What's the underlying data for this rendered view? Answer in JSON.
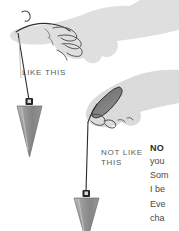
{
  "figure": {
    "type": "instructional-illustration",
    "background_color": "#ffffff"
  },
  "labels": {
    "correct": "LIKE THIS",
    "incorrect": "NOT LIKE\nTHIS"
  },
  "hands": [
    {
      "id": "open-hand",
      "posture": "open relaxed hand, cord draped over fingers",
      "demonstrates": "correct",
      "skin_fill": "#e3e3e3",
      "outline": "#3a3a3a"
    },
    {
      "id": "closed-fist",
      "posture": "clenched fist gripping cord",
      "demonstrates": "incorrect",
      "skin_fill": "#dedede",
      "shadow_fill": "#6f6f6f",
      "outline": "#2f2f2f"
    }
  ],
  "pendulums": [
    {
      "id": "pendulum-correct",
      "cone_fill": "#8b8b8b",
      "cone_highlight": "#b9b9b9",
      "cap_fill": "#2b2b2b",
      "cord_color": "#2b2b2b"
    },
    {
      "id": "pendulum-incorrect",
      "cone_fill": "#8b8b8b",
      "cone_highlight": "#b9b9b9",
      "cap_fill": "#2b2b2b",
      "cord_color": "#2b2b2b",
      "clipped": "bottom edge"
    }
  ],
  "note": {
    "heading": "NO",
    "lines": [
      "you",
      "Som",
      "I be",
      "Eve",
      "cha"
    ],
    "clipped": "right edge of page",
    "heading_color": "#2b2b2b",
    "body_color": "#4a4a4a"
  },
  "colors": {
    "page": "#ffffff",
    "label_text": "#59595c",
    "cone": "#8b8b8b",
    "cord": "#2b2b2b"
  }
}
